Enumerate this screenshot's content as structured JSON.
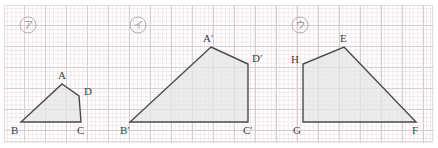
{
  "page": {
    "width": 438,
    "height": 148,
    "background": "#ffffff"
  },
  "grid": {
    "minor_spacing_px": 4.2,
    "major_spacing_px": 21,
    "minor_color": "#efe7e9",
    "major_color": "#d8cdd0",
    "border_color": "#e3dcde",
    "paper_color": "#ffffff"
  },
  "style": {
    "shape_fill": "#e4e4e4",
    "shape_stroke": "#4a4a4a",
    "label_color": "#3d3d3d",
    "circle_label_color": "#8d8d8d"
  },
  "figures": [
    {
      "id": "figure-a",
      "marker": "ア",
      "marker_circle": {
        "cx": 28,
        "cy": 25,
        "r": 8
      },
      "points": "62,84 79,96 81,122 21,122",
      "vertices": [
        {
          "name": "A",
          "label": "A",
          "x": 62,
          "y": 84,
          "label_x": 58,
          "label_y": 79
        },
        {
          "name": "D",
          "label": "D",
          "x": 79,
          "y": 96,
          "label_x": 84,
          "label_y": 95
        },
        {
          "name": "C",
          "label": "C",
          "x": 81,
          "y": 122,
          "label_x": 77,
          "label_y": 134
        },
        {
          "name": "B",
          "label": "B",
          "x": 21,
          "y": 122,
          "label_x": 11,
          "label_y": 134
        }
      ]
    },
    {
      "id": "figure-b",
      "marker": "イ",
      "marker_circle": {
        "cx": 138,
        "cy": 25,
        "r": 8
      },
      "points": "211,47 248,64 248,122 130,122",
      "vertices": [
        {
          "name": "A-prime",
          "label": "A′",
          "x": 211,
          "y": 47,
          "label_x": 203,
          "label_y": 42
        },
        {
          "name": "D-prime",
          "label": "D′",
          "x": 248,
          "y": 64,
          "label_x": 252,
          "label_y": 62
        },
        {
          "name": "C-prime",
          "label": "C′",
          "x": 248,
          "y": 122,
          "label_x": 243,
          "label_y": 134
        },
        {
          "name": "B-prime",
          "label": "B′",
          "x": 130,
          "y": 122,
          "label_x": 120,
          "label_y": 134
        }
      ]
    },
    {
      "id": "figure-c",
      "marker": "ウ",
      "marker_circle": {
        "cx": 300,
        "cy": 25,
        "r": 8
      },
      "points": "344,47 416,122 303,122 303,64",
      "vertices": [
        {
          "name": "E",
          "label": "E",
          "x": 344,
          "y": 47,
          "label_x": 340,
          "label_y": 42
        },
        {
          "name": "F",
          "label": "F",
          "x": 416,
          "y": 122,
          "label_x": 412,
          "label_y": 134
        },
        {
          "name": "G",
          "label": "G",
          "x": 303,
          "y": 122,
          "label_x": 293,
          "label_y": 134
        },
        {
          "name": "H",
          "label": "H",
          "x": 303,
          "y": 64,
          "label_x": 291,
          "label_y": 63
        }
      ]
    }
  ]
}
